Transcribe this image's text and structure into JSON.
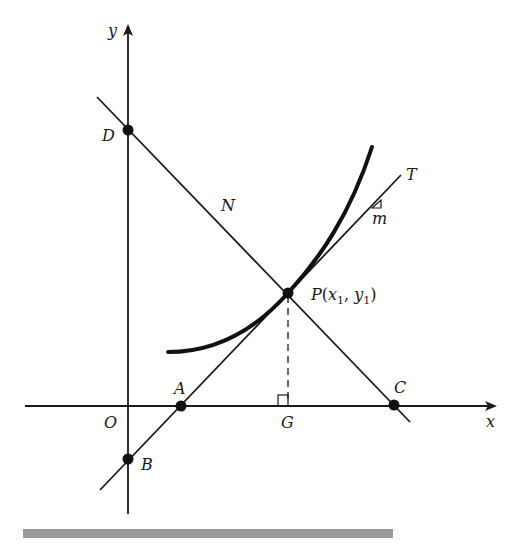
{
  "diagram": {
    "axes": {
      "x_label": "x",
      "y_label": "y",
      "origin_label": "O"
    },
    "points": {
      "A": "A",
      "B": "B",
      "C": "C",
      "D": "D",
      "G": "G",
      "P": {
        "name": "P",
        "open": "(",
        "x": "x",
        "x_sub": "1",
        "sep": ", ",
        "y": "y",
        "y_sub": "1",
        "close": ")"
      }
    },
    "lines": {
      "tangent_label": "T",
      "normal_label": "N",
      "slope_label": "m"
    },
    "colors": {
      "ink": "#1a1a1a",
      "bar": "#9a9a9a",
      "background": "#ffffff"
    }
  }
}
